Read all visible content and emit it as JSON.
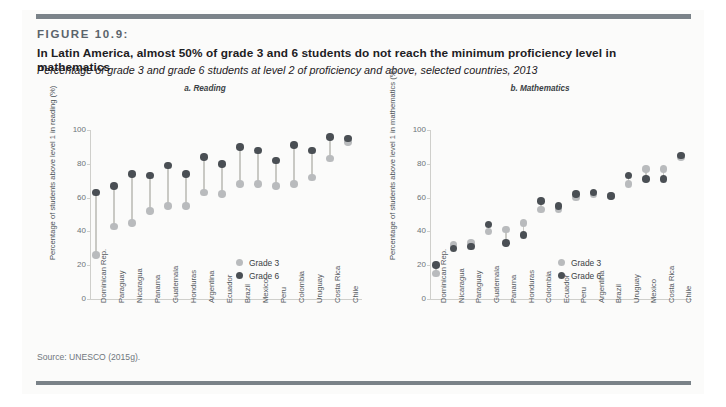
{
  "figure": {
    "number": "FIGURE 10.9:",
    "title": "In Latin America, almost 50% of grade 3 and 6 students do not reach the minimum proficiency level in mathematics",
    "subtitle": "Percentage of grade 3 and grade 6 students at level 2 of proficiency and above, selected countries, 2013",
    "source": "Source: UNESCO (2015g)."
  },
  "legend": {
    "grade3_label": "Grade 3",
    "grade6_label": "Grade 6",
    "grade3_color": "#b9bbbd",
    "grade6_color": "#4a4f54"
  },
  "chart_data": [
    {
      "type": "scatter",
      "id": "reading",
      "title": "a. Reading",
      "xlabel": "",
      "ylabel": "Percentage of students above level 1 in reading (%)",
      "ylim": [
        0,
        100
      ],
      "yticks": [
        0,
        20,
        40,
        60,
        80,
        100
      ],
      "grid": false,
      "legend_position": "inside-right",
      "categories": [
        "Dominican Rep.",
        "Paraguay",
        "Nicaragua",
        "Panama",
        "Guatemala",
        "Honduras",
        "Argentina",
        "Ecuador",
        "Brazil",
        "Mexico",
        "Peru",
        "Colombia",
        "Uruguay",
        "Costa Rica",
        "Chile"
      ],
      "series": [
        {
          "name": "Grade 3",
          "values": [
            26,
            43,
            45,
            52,
            55,
            55,
            63,
            62,
            68,
            68,
            67,
            68,
            72,
            83,
            93
          ]
        },
        {
          "name": "Grade 6",
          "values": [
            63,
            67,
            74,
            73,
            79,
            74,
            84,
            80,
            90,
            88,
            82,
            91,
            88,
            96,
            95
          ]
        }
      ]
    },
    {
      "type": "scatter",
      "id": "mathematics",
      "title": "b. Mathematics",
      "xlabel": "",
      "ylabel": "Percentage of students above level 1 in mathematics (%)",
      "ylim": [
        0,
        100
      ],
      "yticks": [
        0,
        20,
        40,
        60,
        80,
        100
      ],
      "grid": false,
      "legend_position": "inside-right",
      "categories": [
        "Dominican Rep.",
        "Nicaragua",
        "Paraguay",
        "Guatemala",
        "Panama",
        "Honduras",
        "Colombia",
        "Ecuador",
        "Peru",
        "Argentina",
        "Brazil",
        "Uruguay",
        "Mexico",
        "Costa Rica",
        "Chile"
      ],
      "series": [
        {
          "name": "Grade 3",
          "values": [
            15,
            32,
            33,
            40,
            41,
            45,
            53,
            53,
            60,
            62,
            61,
            68,
            77,
            77,
            84
          ]
        },
        {
          "name": "Grade 6",
          "values": [
            20,
            30,
            31,
            44,
            33,
            38,
            58,
            55,
            62,
            63,
            61,
            73,
            71,
            71,
            85
          ]
        }
      ]
    }
  ]
}
